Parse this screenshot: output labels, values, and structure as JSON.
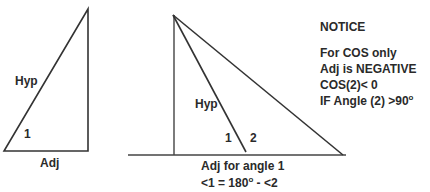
{
  "left_triangle": {
    "hyp_label": "Hyp",
    "angle_label": "1",
    "adj_label": "Adj"
  },
  "right_diagram": {
    "hyp_label": "Hyp",
    "angle1_label": "1",
    "angle2_label": "2",
    "adj_label": "Adj for angle 1",
    "relation_prefix": "<1 = 180",
    "relation_degree": "o",
    "relation_suffix": " - <2"
  },
  "notice": {
    "title": "NOTICE",
    "lines": [
      "For COS only",
      "Adj is NEGATIVE",
      "COS(2)< 0"
    ],
    "angle_line_prefix": "IF Angle (2) >90",
    "angle_line_degree": "o"
  },
  "colors": {
    "stroke": "#333333",
    "text": "#2a2a2a",
    "background": "#ffffff"
  }
}
